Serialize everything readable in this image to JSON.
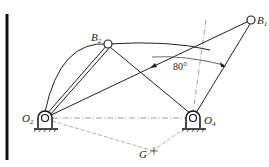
{
  "diagram": {
    "points": {
      "O2": {
        "label": "O",
        "sub": "2"
      },
      "O4": {
        "label": "O",
        "sub": "4"
      },
      "B1": {
        "label": "B",
        "sub": "1"
      },
      "B2": {
        "label": "B",
        "sub": "2"
      },
      "G": {
        "label": "G",
        "sub": ""
      }
    },
    "angle_label": "80°",
    "colors": {
      "line": "#222222",
      "dash": "#888888"
    }
  }
}
